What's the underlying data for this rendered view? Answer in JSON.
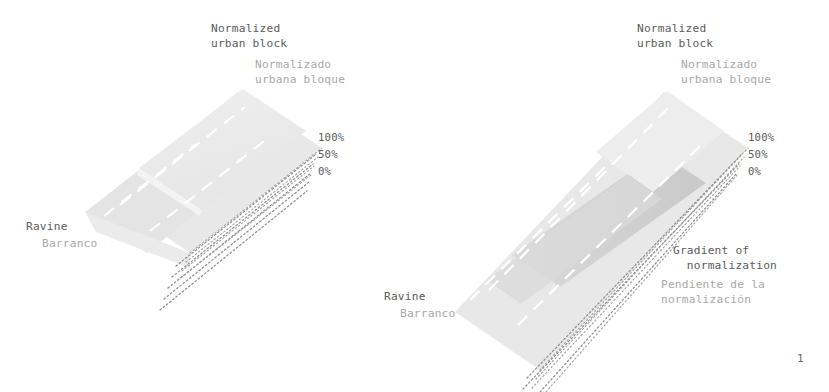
{
  "page": {
    "number": "1",
    "background_color": "#ffffff",
    "text_color_primary": "#5b5b5b",
    "text_color_secondary": "#a8a8a8"
  },
  "palette": {
    "band_lightest": "#ececec",
    "band_light": "#e2e2e2",
    "band_mid": "#dcdcdc",
    "band_dark": "#cfcfcf",
    "dotted_line": "#9a9a9a",
    "dashed_white": "#ffffff"
  },
  "diagrams": [
    {
      "id": "left-diagram",
      "name": "normalized-urban-block-step-profile",
      "heading": {
        "en": "Normalized\nurban block",
        "es": "Normalizado\nurbana bloque"
      },
      "ravine_label": {
        "en": "Ravine",
        "es": "Barranco"
      },
      "scale_labels": [
        "100%",
        "50%",
        "0%"
      ]
    },
    {
      "id": "right-diagram",
      "name": "normalized-urban-block-gradient-profile",
      "heading": {
        "en": "Normalized\nurban block",
        "es": "Normalizado\nurbana bloque"
      },
      "ravine_label": {
        "en": "Ravine",
        "es": "Barranco"
      },
      "scale_labels": [
        "100%",
        "50%",
        "0%"
      ],
      "gradient_label": {
        "en": "Gradient of\n  normalization",
        "es": "Pendiente de la\nnormalización"
      }
    }
  ]
}
